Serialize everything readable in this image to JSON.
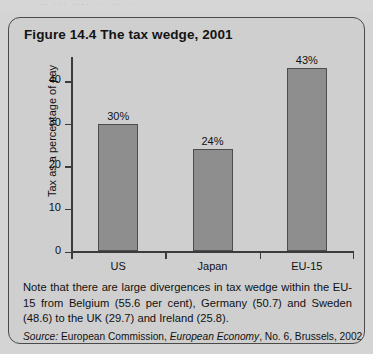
{
  "page": {
    "background_color": "#d4d4d4",
    "top_bleed_text": "·· ··· ···· ·· ··· ··"
  },
  "figure": {
    "title": "Figure 14.4  The tax wedge, 2001",
    "box_color": "#cfcfcf",
    "border_color": "#4a4a4a",
    "note": "Note that there are large divergences in tax wedge within the EU-15 from Belgium (55.6 per cent), Germany (50.7) and Sweden (48.6) to the UK (29.7) and Ireland (25.8).",
    "source_label": "Source:",
    "source_text_1": "European Commission,",
    "source_italic": "European Economy",
    "source_text_2": ", No. 6, Brussels, 2002, p. 94."
  },
  "chart_data": {
    "type": "bar",
    "title": "Figure 14.4  The tax wedge, 2001",
    "categories": [
      "US",
      "Japan",
      "EU-15"
    ],
    "values": [
      30,
      24,
      43
    ],
    "data_labels": [
      "30%",
      "24%",
      "43%"
    ],
    "xlabel": "",
    "ylabel": "Tax as a percentage of pay",
    "ylim": [
      0,
      46
    ],
    "yticks": [
      0,
      10,
      20,
      30,
      40
    ],
    "ytick_labels": [
      "0",
      "10",
      "20",
      "30",
      "40"
    ],
    "grid": false,
    "legend": false,
    "bar_fill_color": "#8e8e8e",
    "bar_edge_color": "#4d4d4d",
    "axis_color": "#3b3b3b"
  }
}
